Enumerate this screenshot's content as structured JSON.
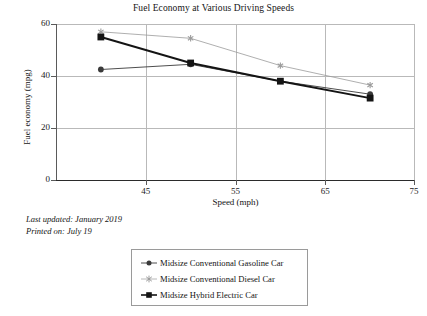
{
  "chart_data": {
    "type": "line",
    "title": "Fuel Economy at Various Driving Speeds",
    "xlabel": "Speed (mph)",
    "ylabel": "Fuel economy (mpg)",
    "x": [
      45,
      55,
      65,
      75
    ],
    "xticklabels": [
      "45",
      "55",
      "65",
      "75"
    ],
    "yticklabels": [
      "0",
      "20",
      "40",
      "60"
    ],
    "yticks": [
      0,
      20,
      40,
      60
    ],
    "xlim": [
      40,
      80
    ],
    "ylim": [
      0,
      60
    ],
    "grid": "horizontal-and-vertical",
    "legend_position": "below-plot",
    "series": [
      {
        "name": "Midsize Conventional Gasoline Car",
        "marker": "circle",
        "color": "#3a3a3a",
        "values": [
          42.5,
          44.5,
          38.0,
          33.0
        ]
      },
      {
        "name": "Midsize Conventional Diesel Car",
        "marker": "star",
        "color": "#9b9b9b",
        "values": [
          57.0,
          54.5,
          44.0,
          36.5
        ]
      },
      {
        "name": "Midsize Hybrid Electric Car",
        "marker": "square",
        "color": "#141414",
        "values": [
          55.0,
          45.0,
          38.0,
          31.5
        ]
      }
    ]
  },
  "footnotes": {
    "last_updated": "Last updated: January 2019",
    "printed_on": "Printed on: July 19"
  },
  "legend": {
    "items": [
      {
        "label": "Midsize Conventional Gasoline Car",
        "marker": "circle-marker-icon"
      },
      {
        "label": "Midsize Conventional Diesel Car",
        "marker": "star-marker-icon"
      },
      {
        "label": "Midsize Hybrid Electric Car",
        "marker": "square-marker-icon"
      }
    ]
  }
}
